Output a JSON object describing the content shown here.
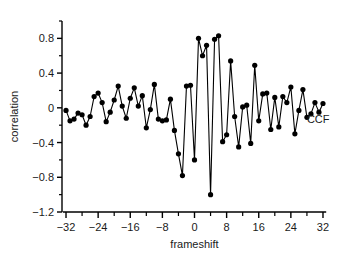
{
  "chart_data": {
    "type": "line",
    "title": "",
    "subtitle": "",
    "xlabel": "frameshift",
    "ylabel": "correlation",
    "xlim": [
      -33,
      33
    ],
    "ylim": [
      -1.2,
      1.0
    ],
    "grid": false,
    "legend_position": "inline-right",
    "annotations": [
      {
        "text": "CCF",
        "x": 28,
        "y": -0.18
      }
    ],
    "x_ticks": [
      -32,
      -24,
      -16,
      -8,
      0,
      8,
      16,
      24,
      32
    ],
    "x_tick_labels": [
      "-32",
      "-24",
      "-16",
      "-8",
      "0",
      "8",
      "16",
      "24",
      "32"
    ],
    "x_minor_ticks": [
      -28,
      -20,
      -12,
      -4,
      4,
      12,
      20,
      28
    ],
    "y_ticks": [
      0.8,
      0.4,
      0,
      -0.4,
      -0.8,
      -1.2
    ],
    "y_tick_labels": [
      "0.8",
      "0.4",
      "0",
      "-0.4",
      "-0.8",
      "-1.2"
    ],
    "y_minor_ticks": [
      1.0,
      0.6,
      0.2,
      -0.2,
      -0.6,
      -1.0
    ],
    "marker": "filled-circle",
    "marker_color": "#000000",
    "line_color": "#000000",
    "series": [
      {
        "name": "CCF",
        "x": [
          -32,
          -31,
          -30,
          -29,
          -28,
          -27,
          -26,
          -25,
          -24,
          -23,
          -22,
          -21,
          -20,
          -19,
          -18,
          -17,
          -16,
          -15,
          -14,
          -13,
          -12,
          -11,
          -10,
          -9,
          -8,
          -7,
          -6,
          -5,
          -4,
          -3,
          -2,
          -1,
          0,
          1,
          2,
          3,
          4,
          5,
          6,
          7,
          8,
          9,
          10,
          11,
          12,
          13,
          14,
          15,
          16,
          17,
          18,
          19,
          20,
          21,
          22,
          23,
          24,
          25,
          26,
          27,
          28,
          29,
          30,
          31,
          32
        ],
        "values": [
          -0.03,
          -0.15,
          -0.13,
          -0.06,
          -0.08,
          -0.2,
          -0.1,
          0.13,
          0.17,
          0.06,
          -0.16,
          -0.05,
          0.09,
          0.25,
          0.02,
          -0.12,
          0.11,
          0.23,
          0.02,
          0.14,
          -0.23,
          -0.02,
          0.27,
          -0.13,
          -0.15,
          -0.14,
          0.1,
          -0.26,
          -0.53,
          -0.78,
          0.25,
          0.26,
          -0.6,
          0.8,
          0.6,
          0.72,
          -1.0,
          0.79,
          0.83,
          -0.39,
          -0.31,
          0.54,
          -0.1,
          -0.45,
          0.01,
          0.03,
          -0.41,
          0.49,
          -0.15,
          0.16,
          0.17,
          -0.25,
          0.12,
          -0.22,
          0.13,
          0.06,
          0.24,
          -0.3,
          -0.03,
          0.21,
          -0.11,
          -0.07,
          0.06,
          -0.05,
          0.05
        ]
      }
    ]
  },
  "figure": {
    "background_color": "#ffffff",
    "foreground_color": "#000000"
  }
}
